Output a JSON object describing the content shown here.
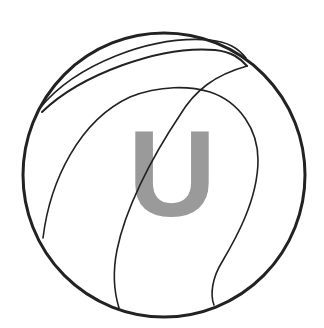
{
  "logo": {
    "letter": "U",
    "letter_color": "#9a9a9a",
    "line_color": "#222222",
    "background": "#ffffff",
    "icon": "volleyball-icon"
  }
}
